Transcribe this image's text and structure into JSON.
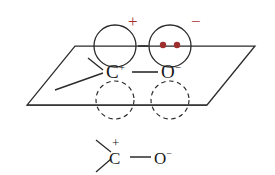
{
  "figure": {
    "background_color": "#ffffff",
    "line_color": "#2b2b2b",
    "text_color": "#1a1a1a",
    "charge_red": "#a8302e",
    "lone_pair_red": "#9e2f2f"
  },
  "orbital_model": {
    "name": "orbital-overlap-model",
    "plane": {
      "name": "molecular-plane-parallelogram",
      "style": "solid-outline",
      "corners": [
        {
          "x": 75,
          "y": 46
        },
        {
          "x": 255,
          "y": 46
        },
        {
          "x": 207,
          "y": 105
        },
        {
          "x": 27,
          "y": 105
        }
      ]
    },
    "orbitals": [
      {
        "name": "carbon-p-orbital-upper-lobe",
        "atom": "C",
        "lobe": "upper",
        "style": "solid",
        "filled": false,
        "electrons": 0,
        "cx": 115,
        "cy": 46,
        "r": 21
      },
      {
        "name": "oxygen-p-orbital-upper-lobe",
        "atom": "O",
        "lobe": "upper",
        "style": "solid",
        "filled": true,
        "electrons": 2,
        "cx": 170,
        "cy": 46,
        "r": 21
      },
      {
        "name": "carbon-p-orbital-lower-lobe",
        "atom": "C",
        "lobe": "lower",
        "style": "dashed",
        "filled": false,
        "electrons": 0,
        "cx": 115,
        "cy": 100,
        "r": 19
      },
      {
        "name": "oxygen-p-orbital-lower-lobe",
        "atom": "O",
        "lobe": "lower",
        "style": "dashed",
        "filled": false,
        "electrons": 0,
        "cx": 170,
        "cy": 100,
        "r": 19
      }
    ],
    "overlap_dash": {
      "name": "orbital-overlap-dash",
      "x1": 138,
      "y1": 46,
      "x2": 148,
      "y2": 46
    },
    "atoms": [
      {
        "name": "carbon-atom-label",
        "symbol": "C",
        "charge": "+",
        "charge_color": "#1a1a1a",
        "x": 106,
        "y": 62
      },
      {
        "name": "oxygen-atom-label",
        "symbol": "O",
        "charge": "−",
        "charge_color": "#1a1a1a",
        "x": 161,
        "y": 62
      }
    ],
    "bonds": [
      {
        "name": "carbon-oxygen-sigma-bond",
        "x1": 132,
        "y1": 72,
        "x2": 158,
        "y2": 72
      },
      {
        "name": "carbon-methyl-bond-upper",
        "x1": 88,
        "y1": 58,
        "x2": 103,
        "y2": 70
      },
      {
        "name": "carbon-methyl-bond-lower",
        "x1": 55,
        "y1": 90,
        "x2": 103,
        "y2": 73
      }
    ],
    "charge_annotations": [
      {
        "name": "positive-charge-annotation",
        "symbol": "+",
        "color": "#a8302e",
        "x": 128,
        "y": 13
      },
      {
        "name": "negative-charge-annotation",
        "symbol": "−",
        "color": "#a8302e",
        "x": 191,
        "y": 13
      }
    ],
    "lone_pair": {
      "name": "oxygen-lone-pair-dots",
      "color": "#9e2f2f",
      "count": 2,
      "dots": [
        {
          "cx": 163,
          "cy": 45,
          "r": 3.2
        },
        {
          "cx": 177,
          "cy": 45,
          "r": 3.2
        }
      ]
    }
  },
  "lewis_structure": {
    "name": "lewis-structure-below",
    "bonds": [
      {
        "name": "methyl-bond-upper-left",
        "x1": 96,
        "y1": 140,
        "x2": 111,
        "y2": 152
      },
      {
        "name": "methyl-bond-lower-left",
        "x1": 96,
        "y1": 172,
        "x2": 111,
        "y2": 159
      },
      {
        "name": "carbon-oxygen-bond",
        "x1": 130,
        "y1": 157,
        "x2": 151,
        "y2": 157
      }
    ],
    "atoms": [
      {
        "name": "carbon-atom-label-lewis",
        "symbol": "C",
        "charge": "+",
        "charge_color": "#1a1a1a",
        "x": 109,
        "y": 150
      },
      {
        "name": "oxygen-atom-label-lewis",
        "symbol": "O",
        "charge": "−",
        "charge_color": "#1a1a1a",
        "x": 154,
        "y": 150
      }
    ],
    "over_charge": {
      "name": "carbon-positive-charge-lewis",
      "symbol": "+",
      "x": 112,
      "y": 136
    }
  }
}
